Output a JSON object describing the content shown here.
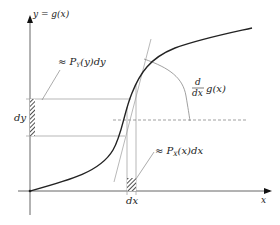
{
  "figure": {
    "type": "change-of-variables diagram",
    "y_axis_label": "y = g(x)",
    "x_axis_label": "x",
    "dy_label": "dy",
    "dx_label": "dx",
    "py_label": "≈ P",
    "py_sub": "Y",
    "py_tail": "(y)dy",
    "px_label": "≈ P",
    "px_sub": "X",
    "px_tail": "(x)dx",
    "deriv_num": "d",
    "deriv_den": "dx",
    "deriv_fn": "g(x)"
  },
  "colors": {
    "curve": "#222222",
    "guide": "#999999",
    "axis": "#555555"
  }
}
